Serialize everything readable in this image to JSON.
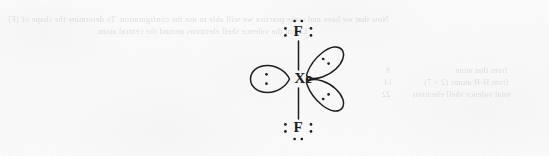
{
  "page": {
    "kind": "scanned-textbook-figure",
    "background_color": "#fbfbfb",
    "ink_color": "#1d1d1f",
    "width": 549,
    "height": 156
  },
  "figure": {
    "molecule": "XeF2",
    "central_atom": {
      "symbol": "Xe",
      "name": "xenon",
      "x": 302,
      "y": 79,
      "lone_pairs": 3
    },
    "terminal_atoms": [
      {
        "symbol": "F",
        "name": "fluorine-top",
        "x": 297,
        "y": 32,
        "lone_pairs": 3,
        "dot_groups": [
          "top",
          "left",
          "right"
        ]
      },
      {
        "symbol": "F",
        "name": "fluorine-bottom",
        "x": 297,
        "y": 128,
        "lone_pairs": 3,
        "dot_groups": [
          "bottom",
          "left",
          "right"
        ]
      }
    ],
    "bonds": [
      {
        "from": "Xe",
        "to": "F-top",
        "order": 1,
        "orientation": "vertical"
      },
      {
        "from": "Xe",
        "to": "F-bottom",
        "order": 1,
        "orientation": "vertical"
      }
    ],
    "lone_pair_lobes": [
      {
        "name": "lobe-left",
        "direction": "left",
        "angle_deg": 180,
        "electrons": 2,
        "dot_layout": "vertical-colon"
      },
      {
        "name": "lobe-upper-right",
        "direction": "upper-right",
        "angle_deg": 52,
        "electrons": 2,
        "dot_layout": "diagonal-pair"
      },
      {
        "name": "lobe-lower-right",
        "direction": "lower-right",
        "angle_deg": -52,
        "electrons": 2,
        "dot_layout": "diagonal-pair"
      }
    ]
  },
  "bleed_through_text": {
    "note": "faint mirrored show-through from the reverse side of the page",
    "left_lines": [
      "Now that we have and some practice we will able to use the configuration. To determine the shape of [F]",
      "Count the valence shell electrons around the central atom."
    ],
    "right_lines": [
      "from that atom",
      "from H-H atoms (2 × 7)",
      "total valence shell electrons"
    ],
    "right_numbers": [
      "8",
      "14",
      "22"
    ]
  }
}
